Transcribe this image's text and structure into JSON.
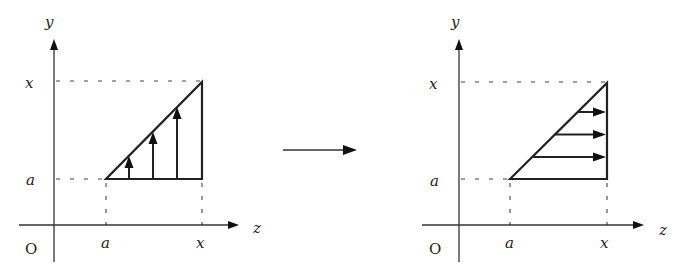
{
  "diagram": {
    "colors": {
      "ink": "#222222",
      "background": "#ffffff"
    },
    "left_panel": {
      "axis_labels": {
        "vertical": "y",
        "horizontal": "z",
        "origin": "O"
      },
      "tick_labels": {
        "y_top": "x",
        "y_bottom": "a",
        "z_left": "a",
        "z_right": "x"
      },
      "region": {
        "shape": "triangle",
        "vertices": [
          [
            "a",
            "a"
          ],
          [
            "x",
            "a"
          ],
          [
            "x",
            "x"
          ]
        ]
      },
      "sweep_arrows": {
        "direction": "up",
        "count": 3
      }
    },
    "transition_arrow": {
      "direction": "right"
    },
    "right_panel": {
      "axis_labels": {
        "vertical": "y",
        "horizontal": "z",
        "origin": "O"
      },
      "tick_labels": {
        "y_top": "x",
        "y_bottom": "a",
        "z_left": "a",
        "z_right": "x"
      },
      "region": {
        "shape": "triangle",
        "vertices": [
          [
            "a",
            "a"
          ],
          [
            "x",
            "a"
          ],
          [
            "x",
            "x"
          ]
        ]
      },
      "sweep_arrows": {
        "direction": "right",
        "count": 3
      }
    }
  }
}
